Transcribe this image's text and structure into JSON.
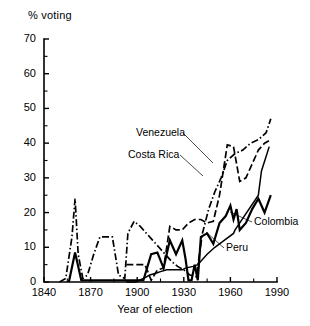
{
  "chart_data": {
    "type": "line",
    "title": "",
    "xlabel": "Year of election",
    "ylabel": "% voting",
    "xlim": [
      1840,
      1990
    ],
    "ylim": [
      0,
      70
    ],
    "grid": false,
    "legend_position": "inline-annotations",
    "x_ticks_major": [
      1840,
      1870,
      1900,
      1930,
      1960,
      1990
    ],
    "x_ticks_minor": [
      1855,
      1885,
      1915,
      1945,
      1975
    ],
    "y_ticks_major": [
      0,
      10,
      20,
      30,
      40,
      50,
      60,
      70
    ],
    "y_ticks_minor": [
      5,
      15,
      25,
      35,
      45,
      55,
      65
    ],
    "series": [
      {
        "name": "Venezuela",
        "style": "dash-dot",
        "x": [
          1850,
          1854,
          1858,
          1860,
          1862,
          1865,
          1868,
          1872,
          1876,
          1880,
          1884,
          1888,
          1892,
          1894,
          1898,
          1902,
          1906,
          1910,
          1914,
          1918,
          1922,
          1926,
          1930,
          1934,
          1938,
          1942,
          1946,
          1950,
          1954,
          1958,
          1963,
          1968,
          1973,
          1978,
          1983,
          1986
        ],
        "y": [
          0,
          1,
          13,
          24,
          8,
          1,
          2,
          8,
          13,
          13,
          13,
          2,
          1,
          14,
          17.5,
          16,
          14,
          12,
          10,
          8,
          6,
          4.5,
          3.5,
          2,
          1.5,
          14,
          21,
          26,
          30,
          35,
          37,
          38,
          40,
          41,
          43,
          47
        ]
      },
      {
        "name": "Costa Rica",
        "style": "dashed",
        "x": [
          1893,
          1897,
          1901,
          1905,
          1909,
          1913,
          1917,
          1921,
          1925,
          1929,
          1933,
          1937,
          1941,
          1945,
          1949,
          1953,
          1958,
          1962,
          1966,
          1970,
          1974,
          1978,
          1982,
          1986
        ],
        "y": [
          5,
          5,
          5,
          5,
          0.5,
          3.5,
          4,
          16,
          15,
          15,
          17,
          18,
          18,
          17,
          17.5,
          25,
          39.5,
          39,
          29,
          30,
          34,
          38,
          40,
          41
        ]
      },
      {
        "name": "Colombia",
        "style": "solid",
        "x": [
          1856,
          1860,
          1864,
          1868,
          1872,
          1876,
          1880,
          1884,
          1888,
          1892,
          1896,
          1900,
          1904,
          1909,
          1913,
          1917,
          1921,
          1925,
          1929,
          1931,
          1933,
          1935,
          1937,
          1939,
          1941,
          1945,
          1949,
          1953,
          1957,
          1960,
          1962,
          1964,
          1966,
          1970,
          1974,
          1978,
          1982,
          1986
        ],
        "y": [
          0,
          8.5,
          0.5,
          0.5,
          0.5,
          0.5,
          0.5,
          0.5,
          0.5,
          0.5,
          0.5,
          0.5,
          0.5,
          8,
          8.5,
          4,
          12,
          8,
          12,
          7,
          0.5,
          0.5,
          5,
          0.5,
          13,
          14,
          11,
          17,
          19,
          22,
          18,
          21,
          15,
          17,
          21,
          24,
          20,
          25
        ]
      },
      {
        "name": "Peru",
        "style": "solid-thin",
        "x": [
          1893,
          1899,
          1904,
          1908,
          1912,
          1915,
          1919,
          1924,
          1929,
          1931,
          1936,
          1939,
          1945,
          1950,
          1956,
          1962,
          1963,
          1978,
          1980,
          1985
        ],
        "y": [
          0,
          0,
          1,
          2,
          2.5,
          3,
          3.5,
          3.5,
          3.5,
          4,
          4.5,
          5,
          8,
          10,
          12,
          14,
          15,
          25,
          32,
          39
        ]
      }
    ]
  },
  "labels": {
    "venezuela": "Venezuela",
    "costa_rica": "Costa Rica",
    "colombia": "Colombia",
    "peru": "Peru"
  },
  "axis": {
    "y_title": "% voting",
    "x_title": "Year of election",
    "y_tick_labels": [
      "0",
      "10",
      "20",
      "30",
      "40",
      "50",
      "60",
      "70"
    ],
    "x_tick_labels": [
      "1840",
      "1870",
      "1900",
      "1930",
      "1960",
      "1990"
    ]
  }
}
